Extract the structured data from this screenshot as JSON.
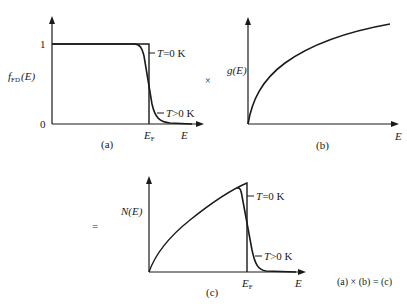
{
  "panels": {
    "a": {
      "caption": "(a)",
      "ylabel": "f",
      "ylabel_sub": "FD",
      "ylabel_arg": "(E)",
      "ytick_one": "1",
      "ytick_zero": "0",
      "xlabel": "E",
      "ef_label": "E",
      "ef_sub": "F",
      "t0_label_T": "T",
      "t0_label_rest": "=0  K",
      "tpos_label_T": "T",
      "tpos_label_rest": ">0  K"
    },
    "b": {
      "caption": "(b)",
      "ylabel": "g(E)",
      "xlabel": "E"
    },
    "c": {
      "caption": "(c)",
      "ylabel": "N(E)",
      "xlabel": "E",
      "ef_label": "E",
      "ef_sub": "F",
      "t0_label_T": "T",
      "t0_label_rest": "=0  K",
      "tpos_label_T": "T",
      "tpos_label_rest": ">0  K"
    }
  },
  "operators": {
    "times": "×",
    "equals": "="
  },
  "equation": "(a) × (b) = (c)",
  "colors": {
    "ink": "#1a1a1a",
    "background": "#ffffff"
  }
}
